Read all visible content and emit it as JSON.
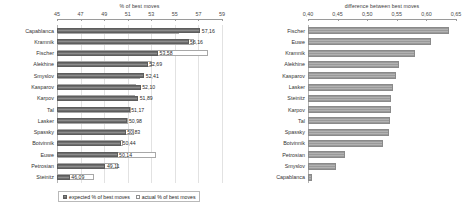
{
  "chart_data": [
    {
      "type": "bar",
      "orientation": "horizontal",
      "title": "% of best moves",
      "xlabel": "",
      "ylabel": "",
      "xlim": [
        45,
        59
      ],
      "ticks": [
        "45",
        "47",
        "49",
        "51",
        "53",
        "55",
        "57",
        "59"
      ],
      "tick_values": [
        45,
        47,
        49,
        51,
        53,
        55,
        57,
        59
      ],
      "grid": true,
      "legend_position": "bottom",
      "categories": [
        "Capablanca",
        "Kramnik",
        "Fischer",
        "Alekhine",
        "Smyslov",
        "Kasparov",
        "Karpov",
        "Tal",
        "Lasker",
        "Spassky",
        "Botvinnik",
        "Euwe",
        "Petrosian",
        "Steinitz"
      ],
      "series": [
        {
          "name": "expected % of best moves",
          "values": [
            57.16,
            56.16,
            53.58,
            52.69,
            52.41,
            52.1,
            51.89,
            51.17,
            50.98,
            50.83,
            50.44,
            50.14,
            49.11,
            46.09
          ],
          "labels": [
            "57,16",
            "56,16",
            "53,58",
            "52,69",
            "52,41",
            "52,10",
            "51,89",
            "51,17",
            "50,98",
            "50,83",
            "50,44",
            "50,14",
            "49,11",
            "46,09"
          ]
        },
        {
          "name": "actual % of best moves",
          "values": [
            55.35,
            56.6,
            57.85,
            53.1,
            52.05,
            51.7,
            51.6,
            51.3,
            51.0,
            51.55,
            50.6,
            53.4,
            50.2,
            48.1
          ]
        }
      ]
    },
    {
      "type": "bar",
      "orientation": "horizontal",
      "title": "difference between best moves",
      "xlabel": "",
      "ylabel": "",
      "xlim": [
        0.4,
        0.65
      ],
      "ticks": [
        "0,40",
        "0,45",
        "0,50",
        "0,55",
        "0,60",
        "0,65"
      ],
      "tick_values": [
        0.4,
        0.45,
        0.5,
        0.55,
        0.6,
        0.65
      ],
      "grid": false,
      "legend_position": "none",
      "categories": [
        "Fischer",
        "Euwe",
        "Kramnik",
        "Alekhine",
        "Kasparov",
        "Lasker",
        "Steinitz",
        "Karpov",
        "Tal",
        "Spassky",
        "Botvinnik",
        "Petrosian",
        "Smyslov",
        "Capablanca"
      ],
      "series": [
        {
          "name": "difference between best moves",
          "values": [
            0.638,
            0.607,
            0.58,
            0.553,
            0.548,
            0.544,
            0.541,
            0.54,
            0.538,
            0.537,
            0.527,
            0.462,
            0.448,
            0.406
          ]
        }
      ]
    }
  ],
  "left_chart": {
    "title": "% of best moves",
    "legend": {
      "expected_label": "expected % of best moves",
      "actual_label": "actual % of best moves"
    }
  },
  "right_chart": {
    "title": "difference between best moves"
  },
  "colors": {
    "expected_bar": "#7d7d7d",
    "actual_bar": "#ffffff",
    "diff_bar": "#a6a6a6",
    "axis": "#9a9a9a",
    "text": "#2b2b2b"
  }
}
